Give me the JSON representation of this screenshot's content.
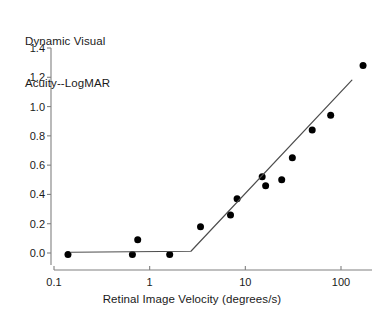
{
  "chart_data": {
    "type": "scatter",
    "title": "",
    "ylabel": "Dynamic Visual\nAcuity--LogMAR",
    "ylabel_line1": "Dynamic Visual",
    "ylabel_line2": "Acuity--LogMAR",
    "xlabel": "Retinal Image Velocity (degrees/s)",
    "xscale": "log",
    "yscale": "linear",
    "xlim": [
      0.1,
      200
    ],
    "ylim": [
      -0.06,
      1.4
    ],
    "grid": false,
    "legend": null,
    "xticks": [
      0.1,
      1,
      10,
      100
    ],
    "xticklabels": [
      "0.1",
      "1",
      "10",
      "100"
    ],
    "yticks": [
      0.0,
      0.2,
      0.4,
      0.6,
      0.8,
      1.0,
      1.2,
      1.4
    ],
    "yticklabels": [
      "0.0",
      "0.2",
      "0.4",
      "0.6",
      "0.8",
      "1.0",
      "1.2",
      "1.4"
    ],
    "marker": "filled-circle",
    "marker_color": "#000000",
    "marker_size_px": 7,
    "series": [
      {
        "name": "Dynamic visual acuity data",
        "type": "scatter",
        "points": [
          {
            "x": 0.14,
            "y": -0.01
          },
          {
            "x": 0.66,
            "y": -0.01
          },
          {
            "x": 0.75,
            "y": 0.09
          },
          {
            "x": 1.62,
            "y": -0.01
          },
          {
            "x": 3.4,
            "y": 0.18
          },
          {
            "x": 7.0,
            "y": 0.26
          },
          {
            "x": 8.2,
            "y": 0.37
          },
          {
            "x": 15.0,
            "y": 0.52
          },
          {
            "x": 16.3,
            "y": 0.46
          },
          {
            "x": 24.0,
            "y": 0.5
          },
          {
            "x": 31.0,
            "y": 0.65
          },
          {
            "x": 50.0,
            "y": 0.84
          },
          {
            "x": 78.0,
            "y": 0.94
          },
          {
            "x": 170.0,
            "y": 1.28
          }
        ]
      },
      {
        "name": "Bilinear fit",
        "type": "line",
        "line_color": "#4d4d4d",
        "line_width_px": 1.2,
        "points": [
          {
            "x": 0.15,
            "y": 0.005
          },
          {
            "x": 2.7,
            "y": 0.012
          },
          {
            "x": 130.0,
            "y": 1.18
          }
        ]
      }
    ],
    "axis_color": "#808080"
  },
  "labels": {
    "y_axis_title_line1": "Dynamic Visual",
    "y_axis_title_line2": "Acuity--LogMAR",
    "x_axis_title": "Retinal Image Velocity (degrees/s)"
  }
}
